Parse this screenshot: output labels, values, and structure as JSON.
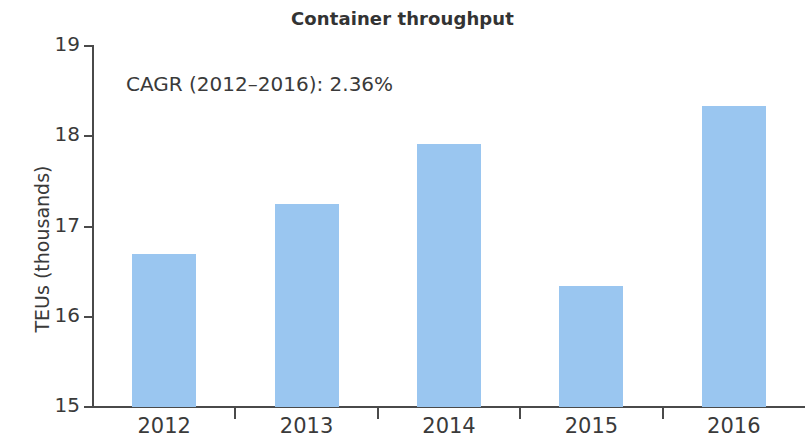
{
  "chart_data": {
    "type": "bar",
    "title": "Container throughput",
    "xlabel": "",
    "ylabel": "TEUs (thousands)",
    "categories": [
      "2012",
      "2013",
      "2014",
      "2015",
      "2016"
    ],
    "values": [
      16.7,
      17.25,
      17.91,
      16.34,
      18.33
    ],
    "ylim": [
      15,
      19
    ],
    "yticks": [
      15,
      16,
      17,
      18,
      19
    ],
    "ytick_labels": [
      "15",
      "16",
      "17",
      "18",
      "19"
    ],
    "grid": false,
    "legend": false,
    "series": [
      {
        "name": "Container throughput",
        "values": [
          16.7,
          17.25,
          17.91,
          16.34,
          18.33
        ]
      }
    ],
    "annotations": [
      {
        "name": "cagr-note",
        "text": "CAGR (2012–2016): 2.36%"
      }
    ],
    "colors": {
      "bar": "#9AC6F0",
      "axis": "#4a4a4a",
      "text": "#3a3a3a",
      "title": "#333333",
      "background": "#ffffff"
    }
  }
}
